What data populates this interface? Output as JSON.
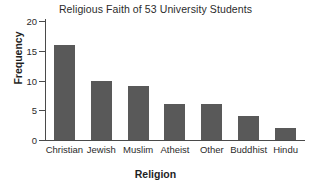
{
  "chart_data": {
    "type": "bar",
    "title": "Religious Faith of 53 University Students",
    "xlabel": "Religion",
    "ylabel": "Frequency",
    "categories": [
      "Christian",
      "Jewish",
      "Muslim",
      "Atheist",
      "Other",
      "Buddhist",
      "Hindu"
    ],
    "values": [
      16,
      10,
      9,
      6,
      6,
      4,
      2
    ],
    "ylim": [
      0,
      20
    ],
    "yticks": [
      0,
      5,
      10,
      15,
      20
    ],
    "ytick_labels": [
      "0",
      "5",
      "10",
      "15",
      "20"
    ],
    "grid": false,
    "legend": false,
    "bar_color": "#595959",
    "axis_color": "#4a4a4a",
    "background_color": "#ffffff"
  }
}
